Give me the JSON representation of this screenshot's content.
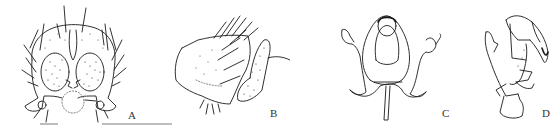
{
  "figure": {
    "background": "#ffffff",
    "ink_color": "#1a1a1a",
    "panels": [
      {
        "id": "A",
        "label": "A",
        "view": "ventral",
        "description": "genitalia, ventral view with setose gonocoxites and stippled lobes"
      },
      {
        "id": "B",
        "label": "B",
        "view": "lateral",
        "description": "genitalia, lateral view with setose plate and stippled appendage"
      },
      {
        "id": "C",
        "label": "C",
        "view": "dorsal",
        "description": "aedeagal complex, dorsal/ventral view with arms and median stem"
      },
      {
        "id": "D",
        "label": "D",
        "view": "lateral",
        "description": "aedeagal complex, lateral view"
      }
    ],
    "caption": {
      "visible": false,
      "note": "caption text cut off at bottom edge"
    }
  }
}
